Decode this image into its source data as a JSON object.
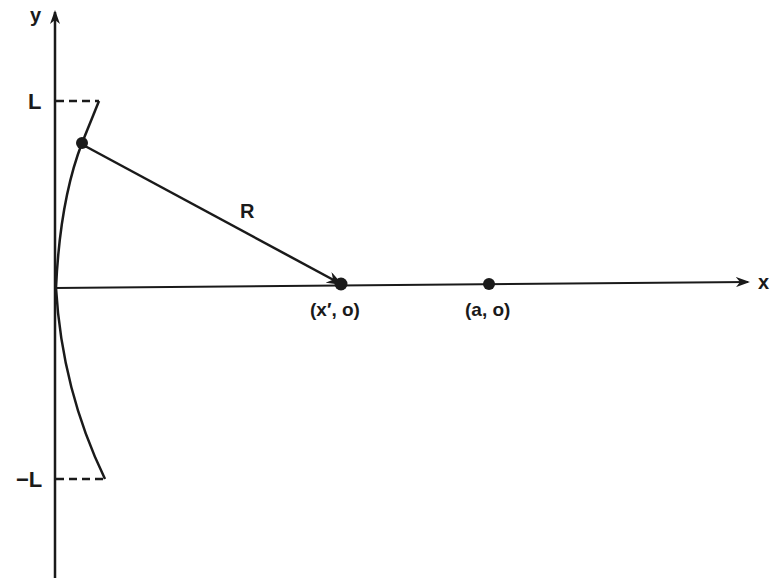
{
  "diagram": {
    "axes": {
      "x_label": "x",
      "y_label": "y"
    },
    "y_ticks": {
      "top": "L",
      "bottom": "−L"
    },
    "vector_label": "R",
    "points": [
      {
        "id": "source",
        "label": "(x′, o)"
      },
      {
        "id": "field",
        "label": "(a, o)"
      }
    ],
    "colors": {
      "ink": "#1a1a1a",
      "background": "#ffffff"
    }
  }
}
